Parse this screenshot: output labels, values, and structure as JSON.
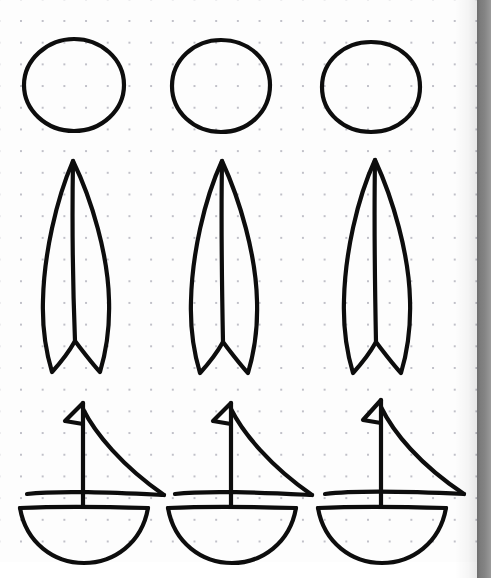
{
  "page": {
    "width": 491,
    "height": 578,
    "background_color": "#ffffff",
    "paper_color": "#fdfdfd",
    "dot_color": "#b9b9c2",
    "ink_color": "#0d0d0d",
    "right_edge_color": "#7b7b7b",
    "paper_right_px": 477,
    "dot_spacing_px": 21.7,
    "dot_origin_px": 20
  },
  "grid": {
    "rows": 3,
    "columns": 3,
    "row_labels": [
      "circle-row",
      "leaf-sail-row",
      "sailboat-row"
    ],
    "column_labels": [
      "column-1",
      "column-2",
      "column-3"
    ]
  },
  "shapes": {
    "circles": [
      {
        "name": "circle-1",
        "cx": 74,
        "cy": 85,
        "rx": 50,
        "ry": 46,
        "stroke_width": 4.2,
        "d": "M 74 39 C 101 39 124 59 124 85 C 124 110 102 131 74 131 C 46 131 24 110 24 85 C 24 60 47 39 74 39 Z"
      },
      {
        "name": "circle-2",
        "cx": 221,
        "cy": 86,
        "rx": 49,
        "ry": 46,
        "stroke_width": 4.2,
        "d": "M 221 40 C 249 40 270 60 270 85 C 270 112 248 132 221 132 C 194 132 172 112 172 86 C 172 60 194 40 221 40 Z"
      },
      {
        "name": "circle-3",
        "cx": 371,
        "cy": 87,
        "rx": 49,
        "ry": 45,
        "stroke_width": 4.2,
        "d": "M 371 42 C 399 42 420 61 420 87 C 420 113 398 132 371 132 C 344 132 322 113 322 87 C 322 61 344 42 371 42 Z"
      }
    ],
    "leaf_sails": [
      {
        "name": "leaf-sail-1",
        "apex_x": 73,
        "apex_y": 161,
        "bottom_y": 372,
        "stroke_width": 4.2,
        "outline_d": "M 73 161 C 56 200 44 255 43 300 C 42 330 46 352 52 372 C 62 361 70 350 75 341 C 82 350 90 361 100 372 C 106 352 110 330 109 300 C 108 255 92 200 73 161 Z",
        "spine_d": "M 73 161 C 72 220 73 290 75 341"
      },
      {
        "name": "leaf-sail-2",
        "apex_x": 222,
        "apex_y": 161,
        "bottom_y": 373,
        "stroke_width": 4.2,
        "outline_d": "M 222 161 C 204 200 192 255 191 301 C 190 331 194 353 200 373 C 210 362 218 351 223 342 C 230 351 238 362 248 373 C 254 353 258 331 257 301 C 256 255 240 200 222 161 Z",
        "spine_d": "M 222 161 C 221 220 222 291 223 342"
      },
      {
        "name": "leaf-sail-3",
        "apex_x": 375,
        "apex_y": 160,
        "bottom_y": 373,
        "stroke_width": 4.2,
        "outline_d": "M 375 160 C 357 199 345 254 344 300 C 343 331 347 353 353 373 C 363 362 371 351 376 342 C 383 351 391 362 401 373 C 407 353 411 331 410 300 C 409 254 393 199 375 160 Z",
        "spine_d": "M 375 160 C 374 220 375 291 376 342"
      }
    ],
    "sailboats": [
      {
        "name": "sailboat-1",
        "stroke_width": 4.2,
        "mast_d": "M 83 403 L 83 507",
        "flag_d": "M 83 403 L 65 421 L 83 424",
        "sail_d": "M 83 409 C 95 433 122 466 164 495",
        "boom_d": "M 27 494 C 60 490 120 493 164 495",
        "deck_d": "M 20 508 C 60 506 115 507 148 508",
        "hull_d": "M 20 508 C 26 543 54 563 84 563 C 114 563 142 543 148 508"
      },
      {
        "name": "sailboat-2",
        "stroke_width": 4.2,
        "mast_d": "M 231 403 L 231 507",
        "flag_d": "M 231 403 L 213 421 L 231 424",
        "sail_d": "M 231 409 C 243 433 270 466 312 495",
        "boom_d": "M 175 494 C 208 490 268 493 312 495",
        "deck_d": "M 168 508 C 208 506 263 507 296 508",
        "hull_d": "M 168 508 C 174 543 202 563 232 563 C 262 563 290 543 296 508"
      },
      {
        "name": "sailboat-3",
        "stroke_width": 4.2,
        "mast_d": "M 381 400 L 381 507",
        "flag_d": "M 381 400 L 363 420 L 381 423",
        "sail_d": "M 381 407 C 393 432 420 465 464 494",
        "boom_d": "M 325 494 C 358 490 420 492 464 494",
        "deck_d": "M 318 508 C 358 506 413 507 446 508",
        "hull_d": "M 318 508 C 324 543 352 563 382 563 C 412 563 440 543 446 508"
      }
    ]
  }
}
